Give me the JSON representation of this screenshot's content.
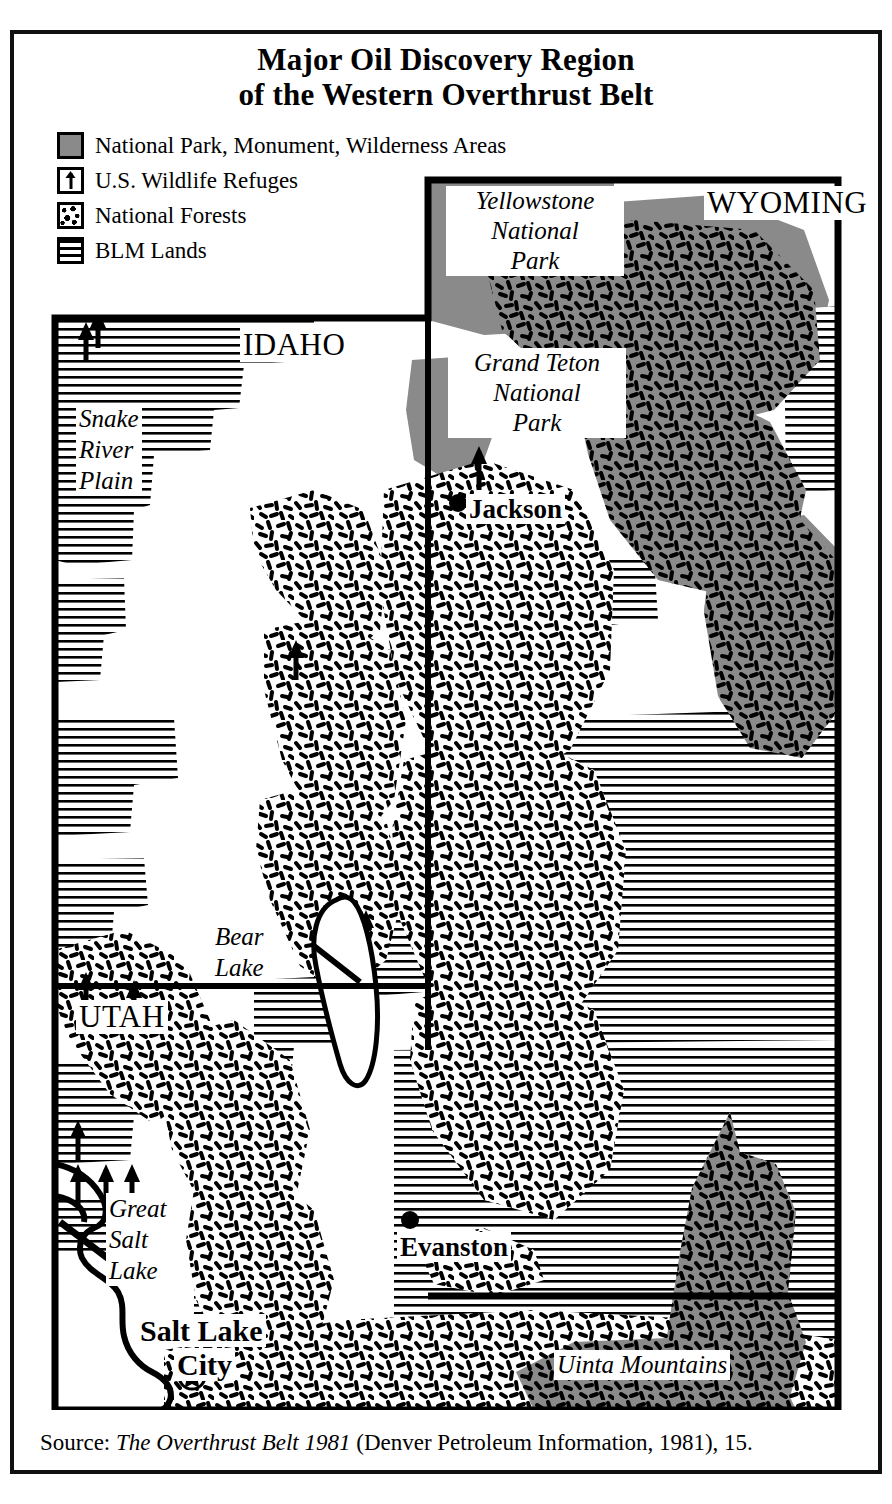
{
  "figure": {
    "title_line1": "Major Oil Discovery Region",
    "title_line2": "of the Western Overthrust Belt"
  },
  "legend": {
    "items": [
      {
        "symbol": "filled-gray-square",
        "label": "National Park, Monument, Wilderness Areas"
      },
      {
        "symbol": "up-arrow-square",
        "label": "U.S. Wildlife Refuges"
      },
      {
        "symbol": "speckle-square",
        "label": "National Forests"
      },
      {
        "symbol": "horizontal-lines-square",
        "label": "BLM Lands"
      }
    ]
  },
  "map": {
    "states": [
      "IDAHO",
      "WYOMING",
      "UTAH"
    ],
    "state_labels": {
      "idaho": "IDAHO",
      "wyoming": "WYOMING",
      "utah": "UTAH"
    },
    "protected_areas": [
      {
        "name": "Yellowstone National Park",
        "line1": "Yellowstone",
        "line2": "National",
        "line3": "Park"
      },
      {
        "name": "Grand Teton National Park",
        "line1": "Grand Teton",
        "line2": "National",
        "line3": "Park"
      }
    ],
    "physical_features": [
      {
        "name": "Snake River Plain",
        "line1": "Snake",
        "line2": "River",
        "line3": "Plain"
      },
      {
        "name": "Bear Lake",
        "line1": "Bear",
        "line2": "Lake"
      },
      {
        "name": "Great Salt Lake",
        "line1": "Great",
        "line2": "Salt",
        "line3": "Lake"
      },
      {
        "name": "Uinta Mountains",
        "line1": "Uinta Mountains"
      }
    ],
    "cities": [
      {
        "name": "Jackson",
        "label": "Jackson",
        "marker": "dot"
      },
      {
        "name": "Evanston",
        "label": "Evanston",
        "marker": "dot"
      },
      {
        "name": "Salt Lake City",
        "line1": "Salt Lake",
        "line2": "City",
        "marker": "star-capital"
      }
    ]
  },
  "source": {
    "prefix": "Source: ",
    "title_italic": "The Overthrust Belt 1981",
    "rest": " (Denver Petroleum Information, 1981), 15."
  },
  "colors": {
    "ink": "#000000",
    "park_gray": "#8a8a8a",
    "paper": "#ffffff"
  }
}
